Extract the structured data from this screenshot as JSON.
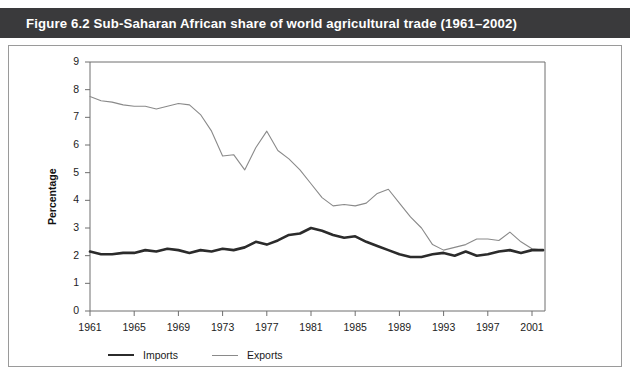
{
  "figure": {
    "title": "Figure 6.2   Sub-Saharan African share of world agricultural trade (1961–2002)",
    "title_number": "Figure 6.2",
    "title_caption": "Sub-Saharan African share of world agricultural trade (1961–2002)"
  },
  "colors": {
    "title_bar": "#3a3a3c",
    "title_text": "#ffffff",
    "panel_background": "#ffffff",
    "panel_border": "#9a9a9a",
    "imports_line": "#2b2b2b",
    "exports_line": "#8a8a8a",
    "axis": "#6e6e6e"
  },
  "legend": {
    "position": "bottom-left",
    "items": [
      {
        "label": "Imports",
        "color": "#2b2b2b",
        "width": "thick"
      },
      {
        "label": "Exports",
        "color": "#8a8a8a",
        "width": "thin"
      }
    ]
  },
  "axes": {
    "y_label": "Percentage",
    "y_ticks": [
      "0",
      "1",
      "2",
      "3",
      "4",
      "5",
      "6",
      "7",
      "8",
      "9"
    ],
    "x_ticks": [
      "1961",
      "1965",
      "1969",
      "1973",
      "1977",
      "1981",
      "1985",
      "1989",
      "1993",
      "1997",
      "2001"
    ]
  },
  "chart_data": {
    "type": "line",
    "title": "Sub-Saharan African share of world agricultural trade (1961–2002)",
    "xlabel": "",
    "ylabel": "Percentage",
    "xlim": [
      1961,
      2002
    ],
    "ylim": [
      0,
      9
    ],
    "grid": false,
    "legend_position": "bottom-left",
    "x": [
      1961,
      1962,
      1963,
      1964,
      1965,
      1966,
      1967,
      1968,
      1969,
      1970,
      1971,
      1972,
      1973,
      1974,
      1975,
      1976,
      1977,
      1978,
      1979,
      1980,
      1981,
      1982,
      1983,
      1984,
      1985,
      1986,
      1987,
      1988,
      1989,
      1990,
      1991,
      1992,
      1993,
      1994,
      1995,
      1996,
      1997,
      1998,
      1999,
      2000,
      2001,
      2002
    ],
    "series": [
      {
        "name": "Exports",
        "color": "#8a8a8a",
        "values": [
          7.75,
          7.6,
          7.55,
          7.45,
          7.4,
          7.4,
          7.3,
          7.4,
          7.5,
          7.45,
          7.1,
          6.5,
          5.6,
          5.65,
          5.1,
          5.9,
          6.5,
          5.8,
          5.5,
          5.1,
          4.6,
          4.1,
          3.8,
          3.85,
          3.8,
          3.9,
          4.25,
          4.4,
          3.9,
          3.4,
          3.0,
          2.4,
          2.2,
          2.3,
          2.4,
          2.6,
          2.6,
          2.55,
          2.85,
          2.5,
          2.25,
          2.2
        ]
      },
      {
        "name": "Imports",
        "color": "#2b2b2b",
        "values": [
          2.15,
          2.05,
          2.05,
          2.1,
          2.1,
          2.2,
          2.15,
          2.25,
          2.2,
          2.1,
          2.2,
          2.15,
          2.25,
          2.2,
          2.3,
          2.5,
          2.4,
          2.55,
          2.75,
          2.8,
          3.0,
          2.9,
          2.75,
          2.65,
          2.7,
          2.5,
          2.35,
          2.2,
          2.05,
          1.95,
          1.95,
          2.05,
          2.1,
          2.0,
          2.15,
          2.0,
          2.05,
          2.15,
          2.2,
          2.1,
          2.2,
          2.2
        ]
      }
    ]
  }
}
